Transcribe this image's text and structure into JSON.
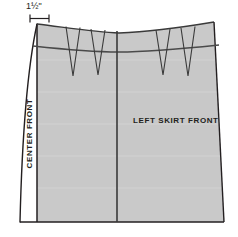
{
  "diagram": {
    "background_color": "#ffffff",
    "fabric_fill": "#c9c9c9",
    "facing_fill": "#ffffff",
    "line_color": "#231f20",
    "seam_line_color": "#4a4a4a",
    "labels": {
      "dimension": "1½\"",
      "center_front": "CENTER FRONT",
      "left_skirt_front": "LEFT SKIRT FRONT"
    },
    "parts": {
      "extension_strip": "left-facing-extension",
      "waistline": "curved-top-waist-edge",
      "hipline": "horizontal-hip-guideline",
      "center_front_line": "center-front-fold-line",
      "hemline": "bottom-hem-edge",
      "side_seam": "right-side-seam"
    },
    "darts": [
      {
        "name": "dart-1",
        "panel": "right-skirt-front",
        "apex_x": 73,
        "apex_y": 76
      },
      {
        "name": "dart-2",
        "panel": "right-skirt-front",
        "apex_x": 98,
        "apex_y": 75
      },
      {
        "name": "dart-3",
        "panel": "left-skirt-front",
        "apex_x": 163,
        "apex_y": 75
      },
      {
        "name": "dart-4",
        "panel": "left-skirt-front",
        "apex_x": 188,
        "apex_y": 76
      }
    ],
    "measurements": [
      {
        "name": "extension-width",
        "value": "1½\"",
        "unit": "inch"
      }
    ]
  }
}
